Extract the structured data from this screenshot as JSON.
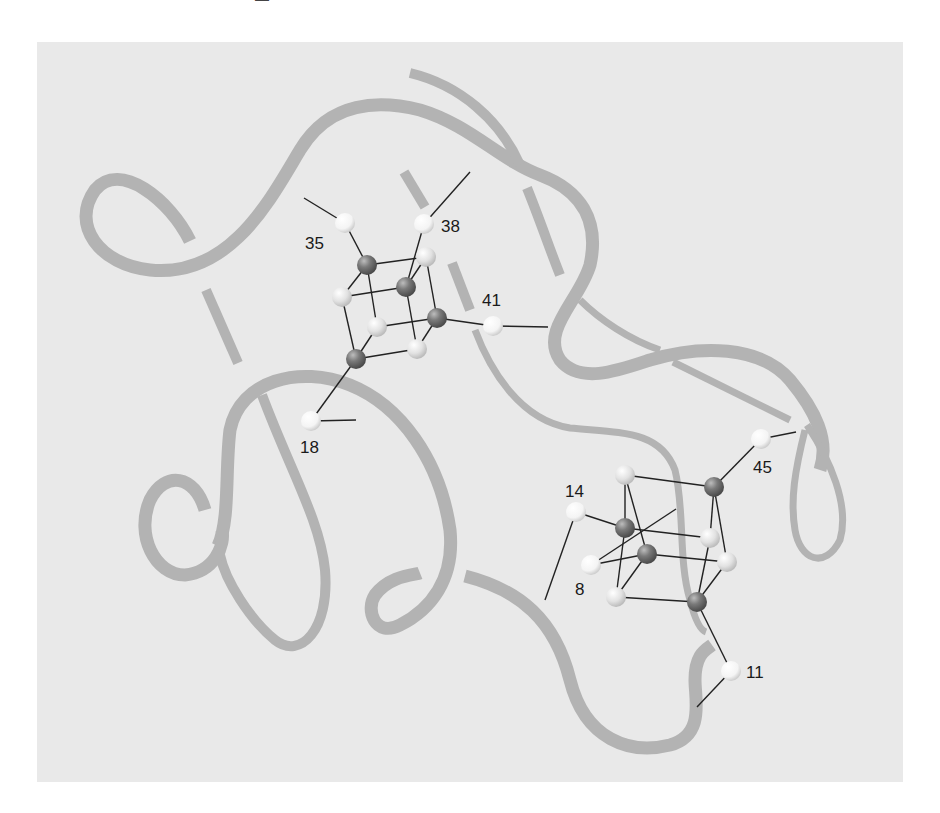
{
  "figure": {
    "colors": {
      "panel_background": "#e9e9e9",
      "ribbon": "#b3b3b3",
      "iron_atom": "#6e6e6e",
      "sulfur_atom": "#d9d9d9",
      "ligand_sulfur": "#f7f7f7",
      "bond": "#222222",
      "label_text": "#1a1a1a"
    },
    "clusters": [
      {
        "name": "cluster-1",
        "ligands": [
          {
            "residue": "35",
            "label": "35"
          },
          {
            "residue": "38",
            "label": "38"
          },
          {
            "residue": "41",
            "label": "41"
          },
          {
            "residue": "18",
            "label": "18"
          }
        ]
      },
      {
        "name": "cluster-2",
        "ligands": [
          {
            "residue": "45",
            "label": "45"
          },
          {
            "residue": "14",
            "label": "14"
          },
          {
            "residue": "8",
            "label": "8"
          },
          {
            "residue": "11",
            "label": "11"
          }
        ]
      }
    ]
  }
}
